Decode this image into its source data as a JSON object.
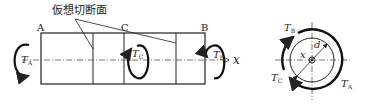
{
  "diagram": {
    "title_label": "仮想切断面",
    "points": {
      "a": "A",
      "c": "C",
      "b": "B"
    },
    "torques": {
      "ta": {
        "sym": "T",
        "sub": "A"
      },
      "tb": {
        "sym": "T",
        "sub": "B"
      },
      "tc": {
        "sym": "T",
        "sub": "C"
      }
    },
    "axis_label": "x",
    "section": {
      "x_label": "x",
      "d_label": "d",
      "tb": {
        "sym": "T",
        "sub": "B"
      },
      "tc": {
        "sym": "T",
        "sub": "C"
      },
      "ta": {
        "sym": "T",
        "sub": "A"
      }
    },
    "colors": {
      "line": "#222222",
      "background": "#ffffff"
    }
  }
}
